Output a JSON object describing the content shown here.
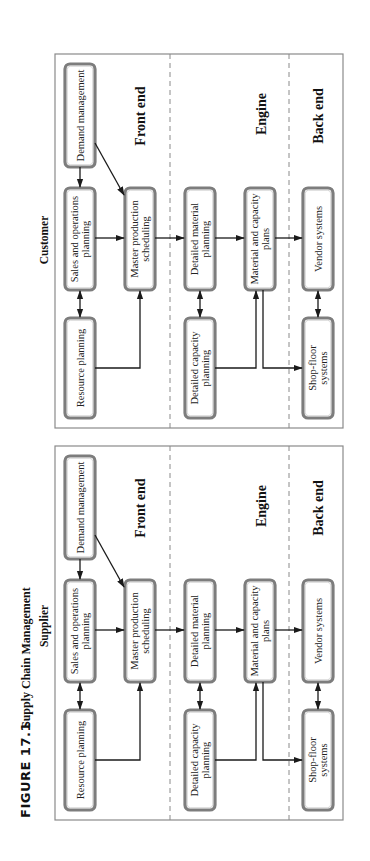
{
  "caption": {
    "figure_number": "FIGURE 17.1",
    "title": "Supply Chain Management"
  },
  "sections": {
    "front_end": "Front end",
    "engine": "Engine",
    "back_end": "Back end"
  },
  "panels": [
    {
      "id": "customer",
      "title": "Customer",
      "boxes": {
        "demand_management": [
          "Demand management"
        ],
        "sales_operations_planning": [
          "Sales and operations",
          "planning"
        ],
        "resource_planning": [
          "Resource planning"
        ],
        "master_production_scheduling": [
          "Master production",
          "scheduling"
        ],
        "detailed_material_planning": [
          "Detailed material",
          "planning"
        ],
        "detailed_capacity_planning": [
          "Detailed capacity",
          "planning"
        ],
        "material_capacity_plans": [
          "Material and capacity",
          "plans"
        ],
        "vendor_systems": [
          "Vendor systems"
        ],
        "shop_floor_systems": [
          "Shop-floor",
          "systems"
        ]
      }
    },
    {
      "id": "supplier",
      "title": "Supplier",
      "boxes": {
        "demand_management": [
          "Demand management"
        ],
        "sales_operations_planning": [
          "Sales and operations",
          "planning"
        ],
        "resource_planning": [
          "Resource planning"
        ],
        "master_production_scheduling": [
          "Master production",
          "scheduling"
        ],
        "detailed_material_planning": [
          "Detailed material",
          "planning"
        ],
        "detailed_capacity_planning": [
          "Detailed capacity",
          "planning"
        ],
        "material_capacity_plans": [
          "Material and capacity",
          "plans"
        ],
        "vendor_systems": [
          "Vendor systems"
        ],
        "shop_floor_systems": [
          "Shop-floor",
          "systems"
        ]
      }
    }
  ],
  "colors": {
    "box_border": "#7d7d7d",
    "frame": "#8a8a8a",
    "line": "#1a1a1a",
    "text": "#222222"
  }
}
